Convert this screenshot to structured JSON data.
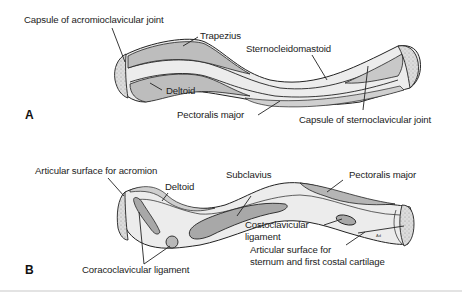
{
  "figure": {
    "panels": [
      {
        "id": "A",
        "label": "A",
        "labels": [
          "Capsule of acromioclavicular joint",
          "Trapezius",
          "Sternocleidomastoid",
          "Deltoid",
          "Pectoralis major",
          "Capsule of sternoclavicular joint"
        ]
      },
      {
        "id": "B",
        "label": "B",
        "labels": [
          "Articular surface for acromion",
          "Deltoid",
          "Subclavius",
          "Pectoralis major",
          "Costoclavicular",
          "ligament",
          "Articular surface for",
          "sternum and first costal cartilage",
          "Coracoclavicular ligament"
        ]
      }
    ],
    "artist_mark": "Ad",
    "colors": {
      "bone_fill": "#ececec",
      "bone_light": "#f6f6f6",
      "muscle_fill": "#bdbdbd",
      "outline": "#222222",
      "articular_fill": "#d9d9d9",
      "rule": "#e3e3e3"
    }
  }
}
